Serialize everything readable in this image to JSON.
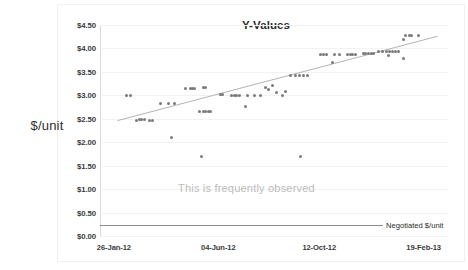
{
  "chart_data": {
    "type": "scatter",
    "title": "Y-Values",
    "xlabel": "",
    "ylabel": "$/unit",
    "grid": true,
    "legend": false,
    "ylim": [
      0.0,
      4.5
    ],
    "ytick_labels": [
      "$4.50",
      "$4.00",
      "$3.50",
      "$3.00",
      "$2.50",
      "$2.00",
      "$1.50",
      "$1.00",
      "$0.50",
      "$0.00"
    ],
    "ytick_values": [
      4.5,
      4.0,
      3.5,
      3.0,
      2.5,
      2.0,
      1.5,
      1.0,
      0.5,
      0.0
    ],
    "xtick_labels": [
      "26-Jan-12",
      "04-Jun-12",
      "12-Oct-12",
      "19-Feb-13"
    ],
    "xtick_positions": [
      0.04,
      0.34,
      0.63,
      0.93
    ],
    "annotations": [
      {
        "text": "This is frequently observed",
        "color": "#bcbcbc"
      },
      {
        "text": "Negotiated $/unit",
        "color": "#2b2b2b"
      }
    ],
    "reference_line": {
      "label": "Negotiated $/unit",
      "value": 0.23,
      "color": "#8c8c8c"
    },
    "trendline": {
      "x0": 0.05,
      "y0": 2.46,
      "x1": 0.97,
      "y1": 4.26,
      "color": "#b4b4b4"
    },
    "marker_color": "#7a7a7a",
    "points": [
      [
        0.075,
        3.0
      ],
      [
        0.088,
        3.0
      ],
      [
        0.105,
        2.47
      ],
      [
        0.113,
        2.48
      ],
      [
        0.12,
        2.48
      ],
      [
        0.127,
        2.48
      ],
      [
        0.142,
        2.46
      ],
      [
        0.15,
        2.46
      ],
      [
        0.175,
        2.82
      ],
      [
        0.196,
        2.82
      ],
      [
        0.215,
        2.83
      ],
      [
        0.205,
        2.1
      ],
      [
        0.247,
        3.15
      ],
      [
        0.259,
        3.15
      ],
      [
        0.266,
        3.15
      ],
      [
        0.272,
        3.15
      ],
      [
        0.297,
        3.16
      ],
      [
        0.304,
        3.16
      ],
      [
        0.285,
        2.66
      ],
      [
        0.296,
        2.66
      ],
      [
        0.303,
        2.66
      ],
      [
        0.311,
        2.66
      ],
      [
        0.318,
        2.66
      ],
      [
        0.292,
        1.7
      ],
      [
        0.345,
        3.01
      ],
      [
        0.353,
        3.01
      ],
      [
        0.378,
        3.0
      ],
      [
        0.386,
        3.0
      ],
      [
        0.393,
        3.0
      ],
      [
        0.401,
        3.0
      ],
      [
        0.425,
        2.99
      ],
      [
        0.443,
        2.99
      ],
      [
        0.46,
        2.99
      ],
      [
        0.417,
        2.76
      ],
      [
        0.477,
        3.17
      ],
      [
        0.484,
        3.12
      ],
      [
        0.496,
        3.21
      ],
      [
        0.508,
        3.07
      ],
      [
        0.523,
        2.99
      ],
      [
        0.534,
        3.08
      ],
      [
        0.548,
        3.42
      ],
      [
        0.561,
        3.42
      ],
      [
        0.573,
        3.42
      ],
      [
        0.585,
        3.42
      ],
      [
        0.597,
        3.42
      ],
      [
        0.575,
        1.7
      ],
      [
        0.634,
        3.88
      ],
      [
        0.643,
        3.88
      ],
      [
        0.651,
        3.88
      ],
      [
        0.675,
        3.88
      ],
      [
        0.688,
        3.88
      ],
      [
        0.712,
        3.88
      ],
      [
        0.72,
        3.88
      ],
      [
        0.727,
        3.88
      ],
      [
        0.735,
        3.88
      ],
      [
        0.667,
        3.7
      ],
      [
        0.756,
        3.89
      ],
      [
        0.764,
        3.89
      ],
      [
        0.771,
        3.89
      ],
      [
        0.779,
        3.89
      ],
      [
        0.787,
        3.9
      ],
      [
        0.8,
        3.93
      ],
      [
        0.812,
        3.93
      ],
      [
        0.822,
        3.93
      ],
      [
        0.833,
        3.94
      ],
      [
        0.841,
        3.94
      ],
      [
        0.849,
        3.94
      ],
      [
        0.857,
        3.94
      ],
      [
        0.828,
        3.85
      ],
      [
        0.872,
        4.2
      ],
      [
        0.879,
        4.27
      ],
      [
        0.888,
        4.28
      ],
      [
        0.896,
        4.28
      ],
      [
        0.916,
        4.28
      ],
      [
        0.873,
        3.78
      ]
    ]
  }
}
